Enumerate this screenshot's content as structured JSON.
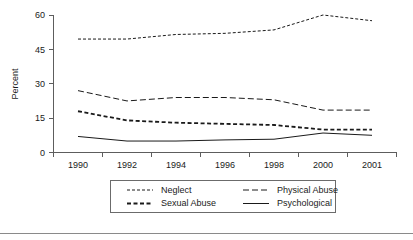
{
  "chart_data": {
    "type": "line",
    "title": "",
    "xlabel": "",
    "ylabel": "Percent",
    "categories": [
      "1990",
      "1992",
      "1994",
      "1996",
      "1998",
      "2000",
      "2001"
    ],
    "x_tick_labels": [
      "1990",
      "1992",
      "1994",
      "1996",
      "1998",
      "2000",
      "2001"
    ],
    "y_tick_labels": [
      "0",
      "15",
      "30",
      "45",
      "60"
    ],
    "y_ticks": [
      0,
      15,
      30,
      45,
      60
    ],
    "ylim": [
      0,
      60
    ],
    "grid": "off",
    "legend_position": "below-plot",
    "series": [
      {
        "name": "Neglect",
        "dash": "dotted-fine",
        "stroke_width": 1,
        "dasharray": "3,2",
        "values": [
          49.5,
          49.5,
          51.5,
          52.0,
          53.5,
          60.0,
          57.5
        ]
      },
      {
        "name": "Physical Abuse",
        "dash": "dashed-medium",
        "stroke_width": 1,
        "dasharray": "6,3",
        "values": [
          27.0,
          22.5,
          24.0,
          24.0,
          23.0,
          18.5,
          18.5
        ]
      },
      {
        "name": "Sexual Abuse",
        "dash": "dashed-bold",
        "stroke_width": 1.8,
        "dasharray": "4,2.5",
        "values": [
          18.0,
          14.0,
          13.0,
          12.5,
          12.0,
          10.0,
          10.0
        ]
      },
      {
        "name": "Psychological",
        "dash": "solid",
        "stroke_width": 1,
        "dasharray": "none",
        "values": [
          7.0,
          5.0,
          5.0,
          5.5,
          5.8,
          8.5,
          7.5
        ]
      }
    ]
  },
  "legend": {
    "entries": [
      {
        "label": "Neglect"
      },
      {
        "label": "Physical Abuse"
      },
      {
        "label": "Sexual Abuse"
      },
      {
        "label": "Psychological"
      }
    ]
  },
  "colors": {
    "ink": "#1a1a1a",
    "axis": "#5d5d5d",
    "legend_border": "#6b6b6b",
    "footer_rule": "#8a8a8a",
    "background": "#ffffff"
  }
}
